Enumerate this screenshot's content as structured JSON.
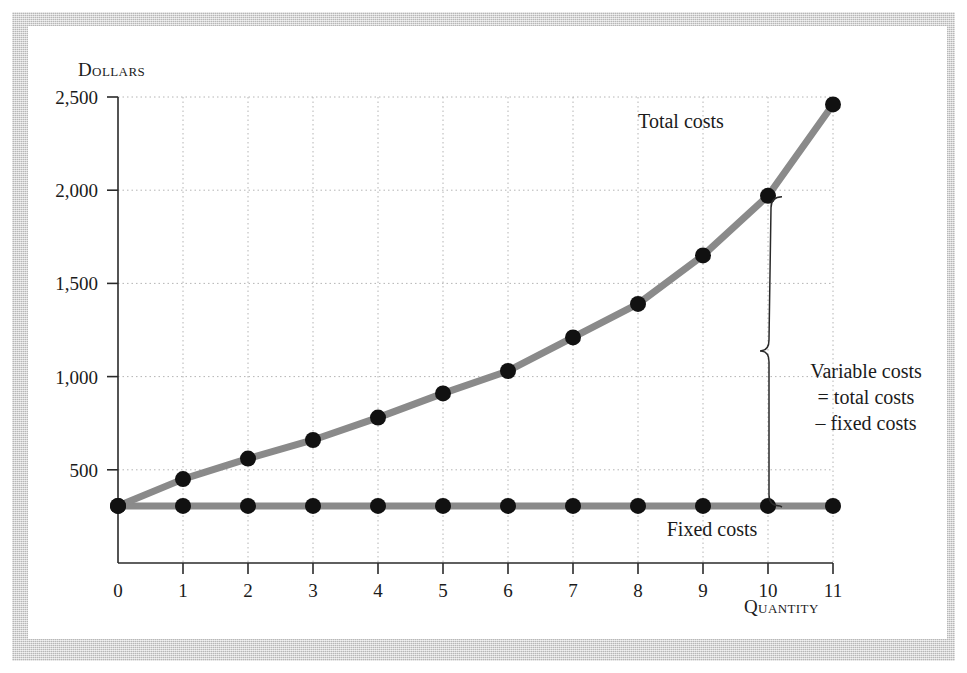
{
  "chart_data": {
    "type": "line",
    "title": "",
    "xlabel": "Quantity",
    "ylabel": "Dollars",
    "xlim": [
      0,
      11
    ],
    "ylim": [
      0,
      2500
    ],
    "grid": true,
    "legend_position": "inline-labels",
    "x": [
      0,
      1,
      2,
      3,
      4,
      5,
      6,
      7,
      8,
      9,
      10,
      11
    ],
    "xtick_labels": [
      "0",
      "1",
      "2",
      "3",
      "4",
      "5",
      "6",
      "7",
      "8",
      "9",
      "10",
      "11"
    ],
    "ytick_values": [
      500,
      1000,
      1500,
      2000,
      2500
    ],
    "ytick_labels": [
      "500",
      "1,000",
      "1,500",
      "2,000",
      "2,500"
    ],
    "series": [
      {
        "name": "Total costs",
        "values": [
          306,
          450,
          560,
          660,
          780,
          910,
          1030,
          1210,
          1390,
          1650,
          1970,
          2460
        ],
        "color": "#8a8a8a",
        "marker_color": "#111111"
      },
      {
        "name": "Fixed costs",
        "values": [
          306,
          306,
          306,
          306,
          306,
          306,
          306,
          306,
          306,
          306,
          306,
          306
        ],
        "color": "#8a8a8a",
        "marker_color": "#111111"
      }
    ],
    "annotations": [
      {
        "name": "total-costs-label",
        "text": "Total costs"
      },
      {
        "name": "fixed-costs-label",
        "text": "Fixed costs"
      },
      {
        "name": "variable-costs-brace-label",
        "lines": [
          "Variable costs",
          "= total costs",
          "– fixed costs"
        ],
        "brace_from_value": 1970,
        "brace_to_value": 306,
        "brace_at_x": 10
      }
    ]
  },
  "labels": {
    "y_axis_title": "Dollars",
    "x_axis_title": "Quantity",
    "total_costs": "Total costs",
    "fixed_costs": "Fixed costs",
    "variable_1": "Variable costs",
    "variable_2": "= total costs",
    "variable_3": "– fixed costs"
  },
  "colors": {
    "frame": "#c9c9c9",
    "plot_bg": "#ffffff",
    "line": "#8a8a8a",
    "marker": "#111111",
    "grid": "#b4b4b4",
    "axis": "#2a2a2a",
    "text": "#1b1b1b"
  }
}
